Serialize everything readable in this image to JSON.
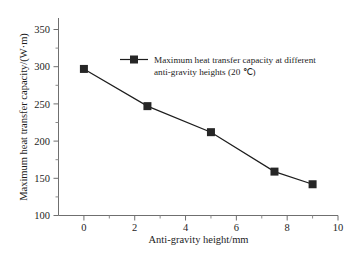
{
  "chart_data": {
    "type": "line",
    "title": "",
    "xlabel": "Anti-gravity height/mm",
    "ylabel": "Maximum heat transfer capacity/(W·m)",
    "xlim": [
      -1,
      10
    ],
    "ylim": [
      100,
      365
    ],
    "xticks": [
      "0",
      "2",
      "4",
      "6",
      "8",
      "10"
    ],
    "xtick_values": [
      0,
      2,
      4,
      6,
      8,
      10
    ],
    "yticks": [
      "100",
      "150",
      "200",
      "250",
      "300",
      "350"
    ],
    "ytick_values": [
      100,
      150,
      200,
      250,
      300,
      350
    ],
    "grid": false,
    "legend_position": "upper-center",
    "marker": "square",
    "line_color": "#1d1d1d",
    "marker_color": "#262626",
    "series": [
      {
        "name": "Maximum heat transfer capacity at different anti-gravity heights (20 ℃)",
        "x": [
          0,
          2.5,
          5,
          7.5,
          9
        ],
        "values": [
          297,
          247,
          212,
          159,
          142
        ]
      }
    ],
    "legend": [
      {
        "line1": "Maximum heat transfer capacity at different",
        "line2": "anti-gravity heights (20 ℃)"
      }
    ]
  },
  "axis": {
    "x_title": "Anti-gravity height/mm",
    "y_title": "Maximum heat transfer capacity/(W·m)"
  }
}
